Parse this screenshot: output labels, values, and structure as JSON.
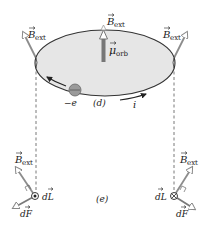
{
  "diagram": {
    "panel_labels": {
      "top": "(d)",
      "bottom": "(e)"
    },
    "loop": {
      "fill_color": "#e6e6e6",
      "stroke_color": "#333333",
      "electron_label": "−e",
      "current_label": "i",
      "moment_label_main": "μ",
      "moment_label_sub": "orb"
    },
    "field_labels": {
      "main": "B",
      "sub": "ext"
    },
    "bottom_left": {
      "dL_label_main": "dL",
      "dF_label_main": "dF",
      "current_symbol": "out-of-page-dot"
    },
    "bottom_right": {
      "dL_label_main": "dL",
      "dF_label_main": "dF",
      "current_symbol": "into-page-cross"
    },
    "colors": {
      "field_arrow": "#8c8c8c",
      "moment_arrow": "#777777",
      "force_arrow": "#7a7a7a",
      "dashed_line": "#555555",
      "electron": "#9a9a9a"
    }
  }
}
